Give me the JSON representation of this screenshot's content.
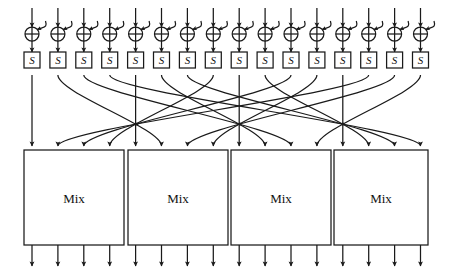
{
  "diagram": {
    "type": "block-cipher-round-schematic",
    "background_color": "#ffffff",
    "line_color": "#1a1a1a",
    "fill_color": "#ffffff",
    "wire_count": 16,
    "geometry": {
      "width": 451,
      "height": 273,
      "first_column_x": 32,
      "column_spacing": 25.9,
      "input_top_y": 8,
      "xor_center_y": 34,
      "xor_radius": 7,
      "sbox_top_y": 52,
      "sbox_size": 16,
      "perm_start_y": 75,
      "perm_end_y": 146,
      "mix_top_y": 150,
      "mix_bottom_y": 245,
      "output_bottom_y": 266
    },
    "xor_nodes": {
      "count": 16,
      "symbol": "⊕",
      "label": "xor-key-addition",
      "has_key_input_hook": true
    },
    "sboxes": {
      "count": 16,
      "label": "S",
      "labels": [
        "S",
        "S",
        "S",
        "S",
        "S",
        "S",
        "S",
        "S",
        "S",
        "S",
        "S",
        "S",
        "S",
        "S",
        "S",
        "S"
      ]
    },
    "permutation": {
      "name": "wire-permutation",
      "description": "Crossing wire network routing 16 S-box outputs into 4 Mix blocks",
      "mapping": [
        0,
        5,
        10,
        15,
        4,
        9,
        14,
        3,
        8,
        13,
        2,
        7,
        12,
        1,
        6,
        11
      ],
      "crossing_nodes": [
        {
          "x": 137,
          "y": 124
        },
        {
          "x": 240,
          "y": 124
        },
        {
          "x": 343,
          "y": 124
        }
      ]
    },
    "mix_blocks": {
      "count": 4,
      "inputs_per_block": 4,
      "outputs_per_block": 4,
      "boxes": [
        {
          "label": "Mix",
          "x": 24,
          "width": 100
        },
        {
          "label": "Mix",
          "x": 128,
          "width": 100
        },
        {
          "label": "Mix",
          "x": 231,
          "width": 100
        },
        {
          "label": "Mix",
          "x": 334,
          "width": 94
        }
      ]
    }
  }
}
